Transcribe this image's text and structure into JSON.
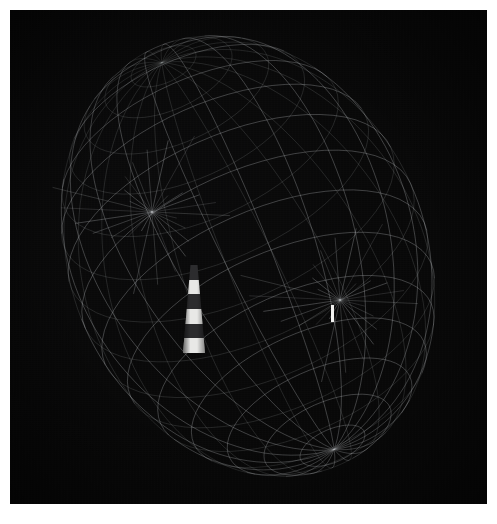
{
  "scene": {
    "title": "3D wireframe scan of a lighthouse",
    "background_color": "#080808",
    "page_margin_color": "#ffffff",
    "wire_color": "#cfd2d6",
    "canvas": {
      "x": 10,
      "y": 10,
      "width": 477,
      "height": 494
    }
  },
  "chart_data": {
    "type": "scatter",
    "title": "3D wireframe scan of a lighthouse",
    "xlabel": "",
    "ylabel": "",
    "projection": "perspective-3d-wireframe",
    "grid": false,
    "legend": "none",
    "mesh": {
      "name": "ellipsoid-wireframe",
      "shape": "ellipsoid",
      "center_px": [
        248,
        256
      ],
      "radius_x_px": 178,
      "radius_y_px": 228,
      "rotation_deg": -24,
      "parallels": 16,
      "meridians": 22,
      "stroke_color": "#cfd2d6",
      "stroke_width": 0.55,
      "stroke_opacity": 0.5
    },
    "features": [
      {
        "name": "mesh-pinch-top-left",
        "label": "convergence node above tower",
        "x_px": 152,
        "y_px": 212,
        "kind": "vertex-cluster"
      },
      {
        "name": "mesh-pinch-right",
        "label": "convergence node at right marker",
        "x_px": 340,
        "y_px": 300,
        "kind": "vertex-cluster"
      }
    ],
    "markers": [
      {
        "name": "lighthouse-tower",
        "label": "lighthouse",
        "x_px": 183,
        "y_px": 265,
        "width_px": 22,
        "height_px": 88,
        "bands": [
          "dark",
          "white",
          "dark",
          "white",
          "dark",
          "white"
        ],
        "band_colors": [
          "#2c2c2e",
          "#e8e8e6"
        ]
      },
      {
        "name": "distant-marker",
        "label": "white post",
        "x_px": 331,
        "y_px": 305,
        "width_px": 3,
        "height_px": 17,
        "color": "#f2f2f0"
      }
    ]
  }
}
